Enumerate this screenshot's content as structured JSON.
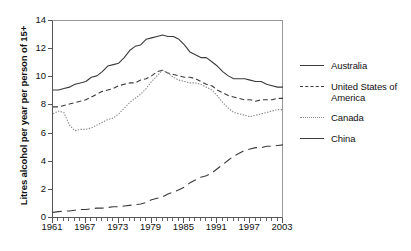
{
  "chart_data": {
    "type": "line",
    "title": "",
    "xlabel": "",
    "ylabel": "Litres alcohol per year per person of 15+",
    "xlim": [
      1961,
      2003
    ],
    "ylim": [
      0,
      14
    ],
    "yticks": [
      0,
      2,
      4,
      6,
      8,
      10,
      12,
      14
    ],
    "xticks": [
      1961,
      1967,
      1973,
      1979,
      1985,
      1991,
      1997,
      2003
    ],
    "grid": false,
    "legend_position": "right",
    "x": [
      1961,
      1962,
      1963,
      1964,
      1965,
      1966,
      1967,
      1968,
      1969,
      1970,
      1971,
      1972,
      1973,
      1974,
      1975,
      1976,
      1977,
      1978,
      1979,
      1980,
      1981,
      1982,
      1983,
      1984,
      1985,
      1986,
      1987,
      1988,
      1989,
      1990,
      1991,
      1992,
      1993,
      1994,
      1995,
      1996,
      1997,
      1998,
      1999,
      2000,
      2001,
      2002,
      2003
    ],
    "series": [
      {
        "name": "Australia",
        "style": "solid",
        "color": "#3a3a3a",
        "values": [
          9.1,
          9.1,
          9.2,
          9.3,
          9.5,
          9.6,
          9.7,
          10.0,
          10.1,
          10.4,
          10.8,
          10.9,
          11.0,
          11.4,
          11.9,
          12.2,
          12.3,
          12.7,
          12.8,
          12.9,
          13.0,
          12.9,
          12.9,
          12.7,
          12.3,
          11.8,
          11.6,
          11.4,
          11.4,
          11.1,
          10.8,
          10.4,
          10.1,
          9.9,
          9.9,
          9.9,
          9.8,
          9.7,
          9.7,
          9.5,
          9.4,
          9.3,
          9.3
        ]
      },
      {
        "name": "United States of America",
        "style": "dashed",
        "color": "#3a3a3a",
        "values": [
          7.9,
          7.9,
          8.0,
          8.1,
          8.2,
          8.3,
          8.4,
          8.6,
          8.8,
          9.0,
          9.1,
          9.2,
          9.4,
          9.5,
          9.6,
          9.6,
          9.8,
          9.9,
          10.1,
          10.4,
          10.5,
          10.3,
          10.2,
          10.1,
          10.0,
          10.0,
          9.9,
          9.7,
          9.5,
          9.4,
          9.1,
          8.9,
          8.7,
          8.6,
          8.5,
          8.4,
          8.4,
          8.3,
          8.4,
          8.4,
          8.4,
          8.5,
          8.5
        ]
      },
      {
        "name": "Canada",
        "style": "dotted",
        "color": "#8a8a8a",
        "values": [
          7.4,
          7.6,
          7.5,
          6.6,
          6.2,
          6.3,
          6.3,
          6.4,
          6.6,
          6.8,
          7.0,
          7.1,
          7.4,
          7.8,
          8.2,
          8.5,
          8.8,
          9.2,
          9.7,
          10.1,
          10.5,
          10.3,
          10.0,
          9.8,
          9.7,
          9.6,
          9.6,
          9.5,
          9.3,
          9.1,
          8.7,
          8.2,
          7.8,
          7.5,
          7.4,
          7.3,
          7.2,
          7.3,
          7.4,
          7.5,
          7.6,
          7.7,
          7.7
        ]
      },
      {
        "name": "China",
        "style": "longdash",
        "color": "#3a3a3a",
        "values": [
          0.4,
          0.45,
          0.5,
          0.5,
          0.55,
          0.6,
          0.6,
          0.65,
          0.7,
          0.7,
          0.75,
          0.8,
          0.8,
          0.85,
          0.9,
          0.95,
          1.0,
          1.1,
          1.3,
          1.4,
          1.5,
          1.7,
          1.85,
          2.0,
          2.2,
          2.5,
          2.7,
          2.9,
          3.0,
          3.2,
          3.5,
          3.8,
          4.1,
          4.4,
          4.6,
          4.8,
          4.9,
          5.0,
          5.0,
          5.1,
          5.1,
          5.15,
          5.2
        ]
      }
    ]
  },
  "axis": {
    "ylabel": "Litres alcohol per year per person of 15+",
    "ytick_labels": [
      "0",
      "2",
      "4",
      "6",
      "8",
      "10",
      "12",
      "14"
    ],
    "xtick_labels": [
      "1961",
      "1967",
      "1973",
      "1979",
      "1985",
      "1991",
      "1997",
      "2003"
    ]
  },
  "legend": {
    "items": [
      {
        "label": "Australia",
        "style": "solid",
        "color": "#3a3a3a"
      },
      {
        "label": "United States of America",
        "style": "dashed",
        "color": "#3a3a3a"
      },
      {
        "label": "Canada",
        "style": "dotted",
        "color": "#8a8a8a"
      },
      {
        "label": "China",
        "style": "longdash",
        "color": "#3a3a3a"
      }
    ]
  }
}
